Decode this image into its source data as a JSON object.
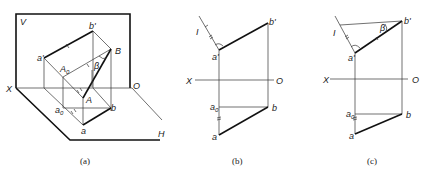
{
  "figures": [
    {
      "id": "a",
      "caption": "(a)",
      "labels": {
        "V": "V",
        "X": "X",
        "O": "O",
        "H": "H",
        "b_prime": "b'",
        "a_prime": "a'",
        "B": "B",
        "A0": "A",
        "A0_sub": "0",
        "A": "A",
        "beta": "β",
        "a0": "a",
        "a0_sub": "0",
        "a": "a",
        "b": "b"
      }
    },
    {
      "id": "b",
      "caption": "(b)",
      "labels": {
        "I": "I",
        "b_prime": "b'",
        "a_prime": "a'",
        "X": "X",
        "O": "O",
        "a0": "a",
        "a0_sub": "0",
        "b": "b",
        "a": "a"
      }
    },
    {
      "id": "c",
      "caption": "(c)",
      "labels": {
        "I": "I",
        "beta": "β",
        "b_prime": "b'",
        "a_prime": "a'",
        "X": "X",
        "O": "O",
        "a0": "a",
        "a0_sub": "0",
        "b": "b",
        "a": "a"
      }
    }
  ]
}
